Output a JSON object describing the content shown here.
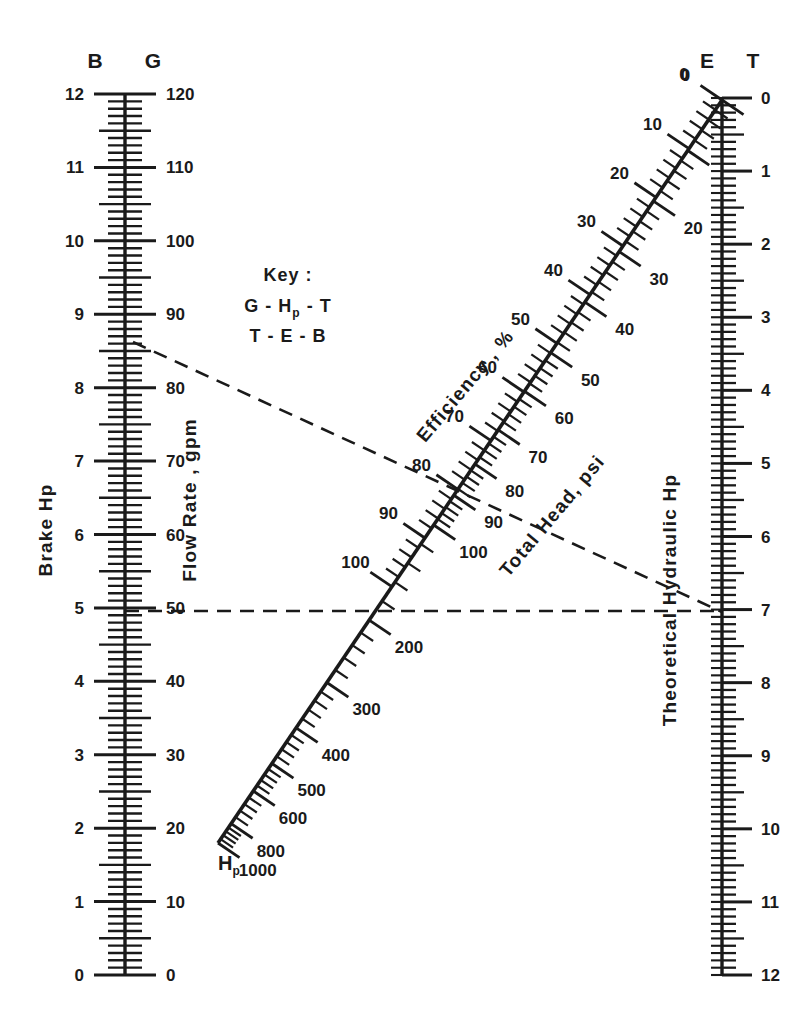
{
  "figure": {
    "type": "nomograph",
    "background": "#ffffff",
    "ink": "#1a1a1a"
  },
  "key": {
    "title": "Key :",
    "line1": "G - H",
    "line1_sub": "p",
    "line1_tail": " - T",
    "line2": "T - E - B"
  },
  "left_axis": {
    "header_left": "B",
    "header_right": "G",
    "title_left": "Brake Hp",
    "title_right": "Flow Rate , gpm",
    "left_labels": [
      "12",
      "11",
      "10",
      "9",
      "8",
      "7",
      "6",
      "5",
      "4",
      "3",
      "2",
      "1",
      "0"
    ],
    "right_labels": [
      "120",
      "110",
      "100",
      "90",
      "80",
      "70",
      "60",
      "50",
      "40",
      "30",
      "20",
      "10",
      "0"
    ],
    "left_min": 0,
    "left_max": 12,
    "right_min": 0,
    "right_max": 120,
    "minor_per_major": 10
  },
  "right_axis": {
    "header": "T",
    "title": "Theoretical Hydraulic Hp",
    "labels": [
      "0",
      "1",
      "2",
      "3",
      "4",
      "5",
      "6",
      "7",
      "8",
      "9",
      "10",
      "11",
      "12"
    ],
    "min": 0,
    "max": 12,
    "minor_per_major": 10
  },
  "diagonal_axis": {
    "header": "E",
    "title_left": "Efficiency , %",
    "title_right": "Total Head, psi",
    "bottom_label": "H",
    "bottom_label_sub": "p",
    "efficiency_labels": [
      "0",
      "10",
      "20",
      "30",
      "40",
      "50",
      "60",
      "70",
      "80",
      "90",
      "100"
    ],
    "total_head_labels": [
      "0",
      "10",
      "20",
      "30",
      "40",
      "50",
      "60",
      "70",
      "80",
      "90",
      "100",
      "200",
      "300",
      "400",
      "500",
      "600",
      "800",
      "1000"
    ]
  },
  "chart_data": {
    "type": "line",
    "subtitle": "Brake Hp / Flow Rate / Efficiency / Total Head / Theoretical Hydraulic Hp",
    "grid": false,
    "legend": "none",
    "scales": [
      {
        "name": "Brake Hp",
        "symbol": "B",
        "orientation": "vertical-left",
        "units": "Hp",
        "min": 0,
        "max": 12,
        "tick_labels": [
          0,
          1,
          2,
          3,
          4,
          5,
          6,
          7,
          8,
          9,
          10,
          11,
          12
        ],
        "direction": "increases upward"
      },
      {
        "name": "Flow Rate",
        "symbol": "G",
        "orientation": "vertical-left",
        "units": "gpm",
        "min": 0,
        "max": 120,
        "tick_labels": [
          0,
          10,
          20,
          30,
          40,
          50,
          60,
          70,
          80,
          90,
          100,
          110,
          120
        ],
        "direction": "increases upward"
      },
      {
        "name": "Efficiency",
        "symbol": "E",
        "orientation": "diagonal",
        "units": "%",
        "min": 0,
        "max": 100,
        "tick_labels": [
          0,
          10,
          20,
          30,
          40,
          50,
          60,
          70,
          80,
          90,
          100
        ],
        "direction": "increases toward lower left"
      },
      {
        "name": "Total Head",
        "symbol": "Hp",
        "orientation": "diagonal",
        "units": "psi",
        "min": 0,
        "max": 1000,
        "tick_labels": [
          0,
          10,
          20,
          30,
          40,
          50,
          60,
          70,
          80,
          90,
          100,
          200,
          300,
          400,
          500,
          600,
          800,
          1000
        ],
        "scale_kind": "logarithmic",
        "direction": "increases toward lower left"
      },
      {
        "name": "Theoretical Hydraulic Hp",
        "symbol": "T",
        "orientation": "vertical-right",
        "units": "Hp",
        "min": 0,
        "max": 12,
        "tick_labels": [
          0,
          1,
          2,
          3,
          4,
          5,
          6,
          7,
          8,
          9,
          10,
          11,
          12
        ],
        "direction": "increases downward"
      }
    ],
    "construction_lines": [
      {
        "name": "T-E-B",
        "style": "dashed",
        "from": {
          "scale": "Brake Hp",
          "value": 8.6
        },
        "to": {
          "scale": "Theoretical Hydraulic Hp",
          "value": 7
        },
        "crosses": {
          "scale": "Efficiency",
          "value": 81
        }
      },
      {
        "name": "G-Hp-T",
        "style": "dashed",
        "from": {
          "scale": "Flow Rate",
          "value": 50
        },
        "to": {
          "scale": "Theoretical Hydraulic Hp",
          "value": 7
        },
        "crosses": {
          "scale": "Total Head",
          "value": 200
        }
      }
    ]
  }
}
